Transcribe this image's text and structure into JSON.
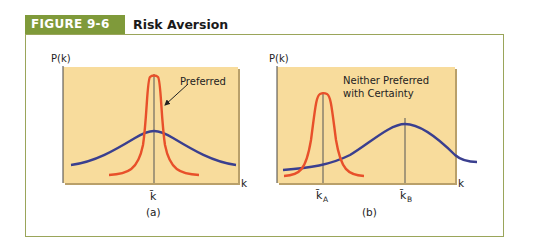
{
  "figure": {
    "number_label": "FIGURE 9-6",
    "title": "Risk Aversion"
  },
  "panel_a": {
    "y_axis_label": "P(k)",
    "x_axis_label": "k",
    "mean_label": "k̄",
    "caption": "(a)",
    "annotation": "Preferred"
  },
  "panel_b": {
    "y_axis_label": "P(k)",
    "x_axis_label": "k",
    "mean_a_label": "k̄",
    "mean_a_sub": "A",
    "mean_b_label": "k̄",
    "mean_b_sub": "B",
    "caption": "(b)",
    "annotation_line1": "Neither Preferred",
    "annotation_line2": "with Certainty"
  },
  "colors": {
    "header_green": "#7f9a3a",
    "frame_border": "#9aa55a",
    "plot_background": "#f8dc9c",
    "narrow_curve": "#e8502a",
    "wide_curve": "#3a3f8f"
  }
}
